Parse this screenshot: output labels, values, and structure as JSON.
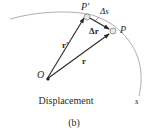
{
  "figure": {
    "caption": "Displacement",
    "sublabel": "(b)"
  },
  "points": {
    "origin": "O",
    "p_initial": "P",
    "p_final": "P′"
  },
  "vectors": {
    "r": "r",
    "r_prime": "r′",
    "delta_r": "Δr"
  },
  "path": {
    "label": "s",
    "arc_length_label": "Δs"
  },
  "colors": {
    "line": "#2a2a2a",
    "curve": "#9a9a9a",
    "particle_fill": "#e6e6e6"
  }
}
